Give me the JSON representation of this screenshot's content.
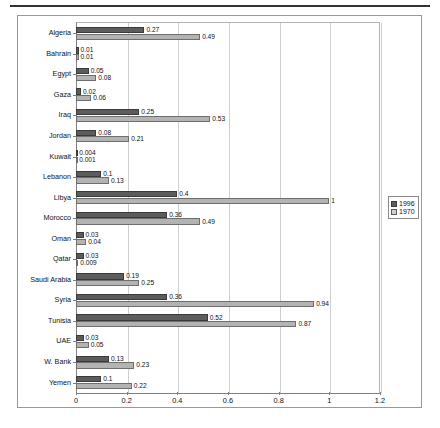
{
  "chart_data": {
    "type": "bar",
    "orientation": "horizontal",
    "title": "",
    "subtitle": "",
    "xlabel": "",
    "ylabel": "",
    "xlim": [
      0,
      1.2
    ],
    "xticks": [
      "0",
      "0.2",
      "0.4",
      "0.6",
      "0.8",
      "1",
      "1.2"
    ],
    "xtick_values": [
      0,
      0.2,
      0.4,
      0.6,
      0.8,
      1,
      1.2
    ],
    "grid": "vertical",
    "legend_position": "right-outside",
    "categories": [
      "Algeria",
      "Bahrain",
      "Egypt",
      "Gaza",
      "Iraq",
      "Jordan",
      "Kuwait",
      "Lebanon",
      "Libya",
      "Morocco",
      "Oman",
      "Qatar",
      "Saudi Arabia",
      "Syria",
      "Tunisia",
      "UAE",
      "W. Bank",
      "Yemen"
    ],
    "series": [
      {
        "name": "1996",
        "color": "#5c5c5c",
        "values": [
          0.27,
          0.01,
          0.05,
          0.02,
          0.25,
          0.08,
          0.004,
          0.1,
          0.4,
          0.36,
          0.03,
          0.03,
          0.19,
          0.36,
          0.52,
          0.03,
          0.13,
          0.1
        ],
        "labels": [
          "0.27",
          "0.01",
          "0.05",
          "0.02",
          "0.25",
          "0.08",
          "0.004",
          "0.1",
          "0.4",
          "0.36",
          "0.03",
          "0.03",
          "0.19",
          "0.36",
          "0.52",
          "0.03",
          "0.13",
          "0.1"
        ]
      },
      {
        "name": "1970",
        "color": "#b3b3b3",
        "values": [
          0.49,
          0.01,
          0.08,
          0.06,
          0.53,
          0.21,
          0.001,
          0.13,
          1,
          0.49,
          0.04,
          0.009,
          0.25,
          0.94,
          0.87,
          0.05,
          0.23,
          0.22
        ],
        "labels": [
          "0.49",
          "0.01",
          "0.08",
          "0.06",
          "0.53",
          "0.21",
          "0.001",
          "0.13",
          "1",
          "0.49",
          "0.04",
          "0.009",
          "0.25",
          "0.94",
          "0.87",
          "0.05",
          "0.23",
          "0.22"
        ]
      }
    ]
  },
  "legend": {
    "items": [
      {
        "label": "1996"
      },
      {
        "label": "1970"
      }
    ]
  }
}
